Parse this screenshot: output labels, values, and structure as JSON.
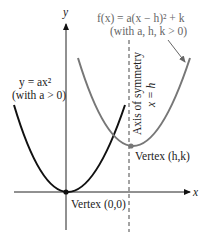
{
  "diagram": {
    "axes": {
      "x_label": "x",
      "y_label": "y"
    },
    "curves": [
      {
        "id": "base",
        "equation": "y = ax²",
        "condition": "(with a > 0)",
        "color": "#111111",
        "vertex_label": "Vertex (0,0)"
      },
      {
        "id": "shifted",
        "equation": "f(x) = a(x − h)² + k",
        "condition": "(with a, h, k > 0)",
        "color": "#777777",
        "vertex_label": "Vertex (h,k)"
      }
    ],
    "axis_of_symmetry": {
      "title": "Axis of symmetry",
      "equation": "x = h"
    }
  }
}
